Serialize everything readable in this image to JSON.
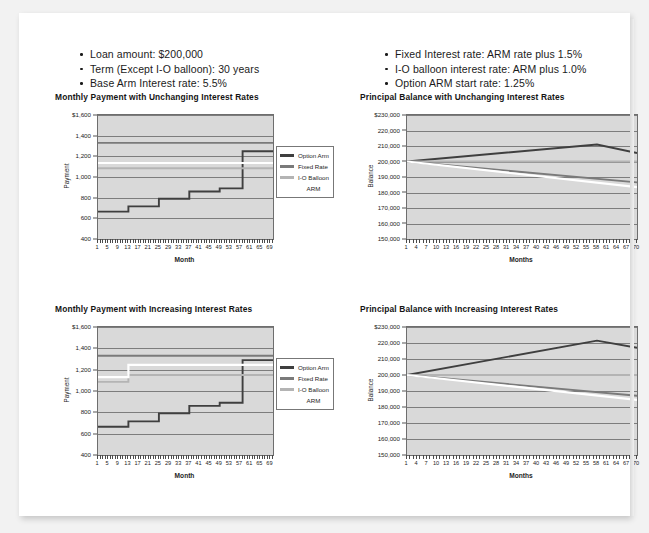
{
  "slide": {
    "bullets_left": [
      "Loan amount: $200,000",
      "Term (Except I-O balloon): 30 years",
      "Base Arm Interest rate: 5.5%"
    ],
    "bullets_right": [
      "Fixed Interest rate: ARM rate plus 1.5%",
      "I-O balloon interest rate: ARM plus 1.0%",
      "Option ARM start rate: 1.25%"
    ]
  },
  "legend": {
    "entries": [
      {
        "label": "Option Arm",
        "color": "#3f3f3f"
      },
      {
        "label": "Fixed Rate",
        "color": "#7a7a7a"
      },
      {
        "label": "I-O Balloon",
        "color": "#b4b4b4"
      },
      {
        "label": "ARM",
        "color": "#ffffff"
      }
    ]
  },
  "colors": {
    "plot_background": "#d9d9d9",
    "axis": "#6e6e6e",
    "gridline": "#6c6c6c",
    "option_arm": "#3f3f3f",
    "fixed_rate": "#7a7a7a",
    "io_balloon": "#b4b4b4",
    "arm": "#ffffff"
  },
  "chart_data": [
    {
      "id": "payment-unchanging",
      "type": "line",
      "title": "Monthly Payment with Unchanging Interest Rates",
      "xlabel": "Month",
      "ylabel": "Payment",
      "ylim": [
        400,
        1600
      ],
      "yticks": [
        400,
        600,
        800,
        1000,
        1200,
        1400,
        1600
      ],
      "ytick_labels": [
        "400",
        "600",
        "800",
        "1,000",
        "1,200",
        "1,400",
        "$1,600"
      ],
      "xlim": [
        1,
        70
      ],
      "xticks": [
        1,
        5,
        9,
        13,
        17,
        21,
        25,
        29,
        33,
        37,
        41,
        45,
        49,
        53,
        57,
        61,
        65,
        69
      ],
      "grid": true,
      "legend_position": "right",
      "series": [
        {
          "name": "Option Arm",
          "color": "#3f3f3f",
          "style": "step",
          "x": [
            1,
            13,
            25,
            37,
            49,
            58,
            70
          ],
          "values": [
            665,
            715,
            790,
            860,
            890,
            1250,
            1250
          ]
        },
        {
          "name": "Fixed Rate",
          "color": "#7a7a7a",
          "style": "flat",
          "x": [
            1,
            70
          ],
          "values": [
            1330,
            1330
          ]
        },
        {
          "name": "I-O Balloon",
          "color": "#b4b4b4",
          "style": "flat",
          "x": [
            1,
            70
          ],
          "values": [
            1085,
            1085
          ]
        },
        {
          "name": "ARM",
          "color": "#ffffff",
          "style": "flat",
          "x": [
            1,
            70
          ],
          "values": [
            1135,
            1135
          ]
        }
      ]
    },
    {
      "id": "balance-unchanging",
      "type": "line",
      "title": "Principal Balance with Unchanging Interest Rates",
      "xlabel": "Months",
      "ylabel": "Balance",
      "ylim": [
        150000,
        230000
      ],
      "yticks": [
        150000,
        160000,
        170000,
        180000,
        190000,
        200000,
        210000,
        220000,
        230000
      ],
      "ytick_labels": [
        "150,000",
        "160,000",
        "170,000",
        "180,000",
        "190,000",
        "200,000",
        "210,000",
        "220,000",
        "$230,000"
      ],
      "xlim": [
        1,
        70
      ],
      "xticks": [
        1,
        4,
        7,
        10,
        13,
        16,
        19,
        22,
        25,
        28,
        31,
        34,
        37,
        40,
        43,
        46,
        49,
        52,
        55,
        58,
        61,
        64,
        67,
        70
      ],
      "grid": true,
      "legend_position": "none",
      "series": [
        {
          "name": "Option Arm",
          "color": "#3f3f3f",
          "style": "line",
          "x": [
            1,
            58,
            70
          ],
          "values": [
            200000,
            211000,
            205500
          ]
        },
        {
          "name": "I-O Balloon",
          "color": "#b4b4b4",
          "style": "line",
          "x": [
            1,
            70
          ],
          "values": [
            200000,
            200000
          ]
        },
        {
          "name": "Fixed Rate",
          "color": "#7a7a7a",
          "style": "line",
          "x": [
            1,
            70
          ],
          "values": [
            200000,
            186500
          ]
        },
        {
          "name": "ARM",
          "color": "#ffffff",
          "style": "line",
          "x": [
            1,
            70
          ],
          "values": [
            200000,
            183500
          ]
        }
      ]
    },
    {
      "id": "payment-increasing",
      "type": "line",
      "title": "Monthly Payment with Increasing Interest Rates",
      "xlabel": "Month",
      "ylabel": "Payment",
      "ylim": [
        400,
        1600
      ],
      "yticks": [
        400,
        600,
        800,
        1000,
        1200,
        1400,
        1600
      ],
      "ytick_labels": [
        "400",
        "600",
        "800",
        "1,000",
        "1,200",
        "1,400",
        "$1,600"
      ],
      "xlim": [
        1,
        70
      ],
      "xticks": [
        1,
        5,
        9,
        13,
        17,
        21,
        25,
        29,
        33,
        37,
        41,
        45,
        49,
        53,
        57,
        61,
        65,
        69
      ],
      "grid": true,
      "legend_position": "right",
      "series": [
        {
          "name": "Option Arm",
          "color": "#3f3f3f",
          "style": "step",
          "x": [
            1,
            13,
            25,
            37,
            49,
            58,
            70
          ],
          "values": [
            665,
            715,
            790,
            860,
            890,
            1290,
            1290
          ]
        },
        {
          "name": "Fixed Rate",
          "color": "#7a7a7a",
          "style": "flat",
          "x": [
            1,
            70
          ],
          "values": [
            1330,
            1330
          ]
        },
        {
          "name": "I-O Balloon",
          "color": "#b4b4b4",
          "style": "step",
          "x": [
            1,
            13,
            70
          ],
          "values": [
            1085,
            1150,
            1150
          ]
        },
        {
          "name": "ARM",
          "color": "#ffffff",
          "style": "step",
          "x": [
            1,
            13,
            70
          ],
          "values": [
            1130,
            1245,
            1245
          ]
        }
      ]
    },
    {
      "id": "balance-increasing",
      "type": "line",
      "title": "Principal Balance with Increasing Interest Rates",
      "xlabel": "Months",
      "ylabel": "Balance",
      "ylim": [
        150000,
        230000
      ],
      "yticks": [
        150000,
        160000,
        170000,
        180000,
        190000,
        200000,
        210000,
        220000,
        230000
      ],
      "ytick_labels": [
        "150,000",
        "160,000",
        "170,000",
        "180,000",
        "190,000",
        "200,000",
        "210,000",
        "220,000",
        "$230,000"
      ],
      "xlim": [
        1,
        70
      ],
      "xticks": [
        1,
        4,
        7,
        10,
        13,
        16,
        19,
        22,
        25,
        28,
        31,
        34,
        37,
        40,
        43,
        46,
        49,
        52,
        55,
        58,
        61,
        64,
        67,
        70
      ],
      "grid": true,
      "legend_position": "none",
      "series": [
        {
          "name": "Option Arm",
          "color": "#3f3f3f",
          "style": "line",
          "x": [
            1,
            58,
            70
          ],
          "values": [
            200000,
            221500,
            217000
          ]
        },
        {
          "name": "I-O Balloon",
          "color": "#b4b4b4",
          "style": "line",
          "x": [
            1,
            70
          ],
          "values": [
            200000,
            200000
          ]
        },
        {
          "name": "Fixed Rate",
          "color": "#7a7a7a",
          "style": "line",
          "x": [
            1,
            70
          ],
          "values": [
            200000,
            187000
          ]
        },
        {
          "name": "ARM",
          "color": "#ffffff",
          "style": "line",
          "x": [
            1,
            70
          ],
          "values": [
            200000,
            184500
          ]
        }
      ]
    }
  ]
}
